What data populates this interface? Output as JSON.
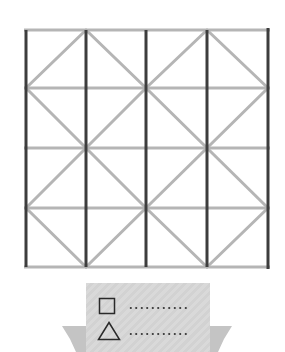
{
  "figure": {
    "type": "square grid with diagonals puzzle",
    "grid": {
      "columns": 4,
      "rows": 4,
      "x_lines": [
        26,
        86,
        146,
        207,
        268
      ],
      "y_lines": [
        30,
        88,
        148,
        208,
        267
      ]
    },
    "colors": {
      "vertical_lines": "#3d3d3d",
      "horizontal_lines": "#b5b5b5",
      "diagonal_lines": "#b5b5b5",
      "legend_background": "#d6d6d6",
      "ribbon_tail": "#c4c4c4"
    }
  },
  "legend": {
    "items": [
      {
        "shape": "square-icon",
        "value": ""
      },
      {
        "shape": "triangle-icon",
        "value": ""
      }
    ]
  }
}
